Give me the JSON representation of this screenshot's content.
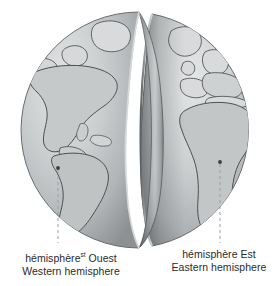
{
  "figure": {
    "background_color": "#ffffff",
    "ocean_color": "#b9bcbd",
    "land_color": "#d4d6d7",
    "outline_color": "#4d5052",
    "cut_face_color": "#8f9294",
    "marker_color": "#3a3c3e",
    "leader_line_color": "#9b9ea0",
    "text_color": "#2b2b2b"
  },
  "labels": {
    "west": {
      "line1_prefix": "hémisphère",
      "line1_superscript": "st",
      "line1_suffix": "Ouest",
      "line2": "Western hemisphere"
    },
    "east": {
      "line1": "hémisphère Est",
      "line2": "Eastern hemisphere"
    }
  },
  "markers": {
    "west": {
      "x": 58,
      "y": 168,
      "label": "western-hemisphere-marker"
    },
    "east": {
      "x": 220,
      "y": 162,
      "label": "eastern-hemisphere-marker"
    }
  },
  "leader_lines": {
    "west": {
      "x": 58,
      "y_start": 170,
      "y_end": 243
    },
    "east": {
      "x": 220,
      "y_start": 164,
      "y_end": 243
    }
  },
  "globe": {
    "center_x": 139,
    "center_y": 130,
    "radius_x": 118,
    "radius_y": 118,
    "split_gap_center_x": 146,
    "continents_west": [
      "North America",
      "South America",
      "Greenland",
      "Caribbean"
    ],
    "continents_east": [
      "Europe",
      "Africa",
      "Greenland",
      "Mediterranean"
    ]
  }
}
